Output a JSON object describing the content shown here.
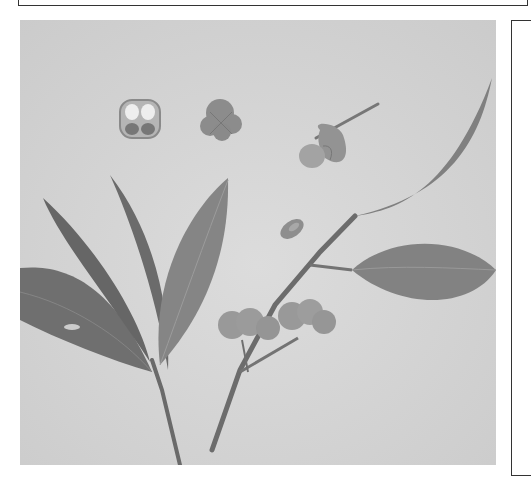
{
  "page": {
    "type": "scanned book page",
    "figure": {
      "description": "Grayscale botanical photograph of a spindle tree (Euonymus) branch with leaves, fruits, and dissected fruit sections",
      "elements": [
        "fruit-cross-section",
        "whole-fruit-top-view",
        "opened-fruit-with-stalk",
        "seed",
        "leafy-stem-left",
        "fruiting-branch-right"
      ]
    },
    "colors": {
      "background": "#d4d4d4",
      "leaf_dark": "#6e6e6e",
      "leaf_mid": "#8a8a8a",
      "fruit": "#9a9a9a",
      "stem": "#6a6a6a",
      "border": "#333333"
    }
  }
}
